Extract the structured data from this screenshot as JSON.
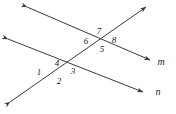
{
  "figure": {
    "background_color": "#ffffff",
    "stroke_color": "#3a3a3a",
    "text_color": "#1a1a1a",
    "lines": [
      {
        "name": "transversal",
        "label": "",
        "x1": 10,
        "y1": 102,
        "x2": 146,
        "y2": 7,
        "arrow_start": true,
        "arrow_end": true
      },
      {
        "name": "line-m",
        "label": "m",
        "label_x": 161,
        "label_y": 62,
        "x1": 27,
        "y1": 7,
        "x2": 150,
        "y2": 60,
        "arrow_start": true,
        "arrow_end": true
      },
      {
        "name": "line-n",
        "label": "n",
        "label_x": 158,
        "label_y": 92,
        "x1": 8,
        "y1": 39,
        "x2": 143,
        "y2": 92,
        "arrow_start": true,
        "arrow_end": true
      }
    ],
    "intersections": [
      {
        "name": "upper-intersection",
        "x": 100,
        "y": 40
      },
      {
        "name": "lower-intersection",
        "x": 57,
        "y": 74
      }
    ],
    "angle_labels": [
      {
        "id": "1",
        "text": "1",
        "x": 39,
        "y": 72
      },
      {
        "id": "2",
        "text": "2",
        "x": 59,
        "y": 81
      },
      {
        "id": "3",
        "text": "3",
        "x": 73,
        "y": 71
      },
      {
        "id": "4",
        "text": "4",
        "x": 57,
        "y": 63
      },
      {
        "id": "5",
        "text": "5",
        "x": 102,
        "y": 49
      },
      {
        "id": "6",
        "text": "6",
        "x": 86,
        "y": 41
      },
      {
        "id": "7",
        "text": "7",
        "x": 99,
        "y": 31
      },
      {
        "id": "8",
        "text": "8",
        "x": 114,
        "y": 40
      }
    ]
  }
}
